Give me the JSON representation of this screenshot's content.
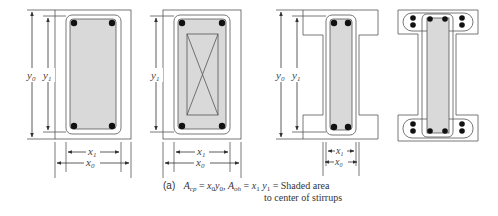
{
  "figure": {
    "panels": [
      {
        "id": "solid-rectangular",
        "labels": {
          "y_outer": "y",
          "y_outer_sub": "0",
          "y_inner": "y",
          "y_inner_sub": "1",
          "x_inner": "x",
          "x_inner_sub": "1",
          "x_outer": "x",
          "x_outer_sub": "0"
        }
      },
      {
        "id": "hollow-rectangular",
        "labels": {
          "y_inner": "y",
          "y_inner_sub": "1",
          "x_inner": "x",
          "x_inner_sub": "1",
          "x_outer": "x",
          "x_outer_sub": "0"
        }
      },
      {
        "id": "i-section-flanged",
        "labels": {
          "y_outer": "y",
          "y_outer_sub": "0",
          "y_inner": "y",
          "y_inner_sub": "1",
          "x_inner": "x",
          "x_inner_sub": "1",
          "x_outer": "x",
          "x_outer_sub": "0"
        }
      },
      {
        "id": "i-section-with-flange-stirrups",
        "labels": {}
      }
    ],
    "colors": {
      "line": "#555555",
      "shaded": "#d9d9d9",
      "rebar": "#111111"
    }
  },
  "caption": {
    "label": "(a)",
    "A": "A",
    "cp_sub": "cp",
    "eq1": "=",
    "x0": "x",
    "x0_sub": "0",
    "y0": "y",
    "y0_sub": "0",
    "sep": ",",
    "oh_sub": "oh",
    "eq2": "=",
    "x1": "x",
    "x1_sub": "1",
    "y1": "y",
    "y1_sub": "1",
    "eq3": "= Shaded area",
    "line2": "to center of stirrups"
  }
}
